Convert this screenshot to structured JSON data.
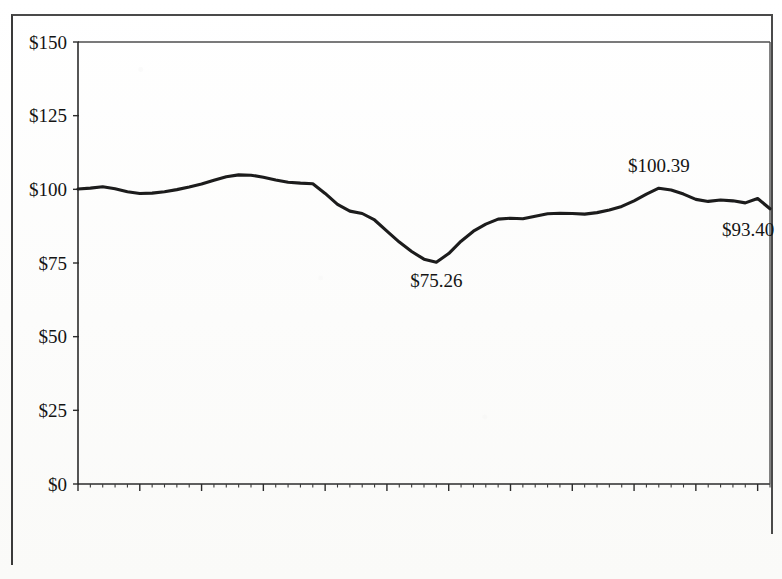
{
  "chart_data": {
    "type": "line",
    "title": "",
    "subtitle": "",
    "xlabel": "",
    "ylabel": "",
    "ylim": [
      0,
      150
    ],
    "xlim": [
      1954,
      2010
    ],
    "grid": false,
    "legend": false,
    "legend_position": "none",
    "y_ticks": [
      0,
      25,
      50,
      75,
      100,
      125,
      150
    ],
    "y_tick_labels": [
      "$0",
      "$25",
      "$50",
      "$75",
      "$100",
      "$125",
      "$150"
    ],
    "x_tick_labels": [
      "1954年",
      "1959年",
      "1964年",
      "1969年",
      "1974年",
      "1979年",
      "1984年",
      "1989年",
      "1994年",
      "1999年",
      "2004年",
      "2009年"
    ],
    "x_tick_values": [
      1954,
      1959,
      1964,
      1969,
      1974,
      1979,
      1984,
      1989,
      1994,
      1999,
      2004,
      2009
    ],
    "x_minor_step": 1,
    "line_color": "#1c1c1c",
    "series": [
      {
        "name": "value",
        "x": [
          1954,
          1955,
          1956,
          1957,
          1958,
          1959,
          1960,
          1961,
          1962,
          1963,
          1964,
          1965,
          1966,
          1967,
          1968,
          1969,
          1970,
          1971,
          1972,
          1973,
          1974,
          1975,
          1976,
          1977,
          1978,
          1979,
          1980,
          1981,
          1982,
          1983,
          1984,
          1985,
          1986,
          1987,
          1988,
          1989,
          1990,
          1991,
          1992,
          1993,
          1994,
          1995,
          1996,
          1997,
          1998,
          1999,
          2000,
          2001,
          2002,
          2003,
          2004,
          2005,
          2006,
          2007,
          2008,
          2009,
          2010
        ],
        "values": [
          100.1,
          100.4,
          100.9,
          100.2,
          99.2,
          98.6,
          98.7,
          99.2,
          99.9,
          100.8,
          101.8,
          103.1,
          104.3,
          104.9,
          104.8,
          104.1,
          103.2,
          102.4,
          102.1,
          101.9,
          98.6,
          94.9,
          92.6,
          91.8,
          89.6,
          85.8,
          82.1,
          78.9,
          76.3,
          75.26,
          78.2,
          82.4,
          85.8,
          88.2,
          89.9,
          90.2,
          90.0,
          90.9,
          91.7,
          91.9,
          91.8,
          91.6,
          92.1,
          93.0,
          94.2,
          96.1,
          98.4,
          100.39,
          99.8,
          98.4,
          96.6,
          95.9,
          96.4,
          96.1,
          95.4,
          96.9,
          93.4
        ]
      }
    ],
    "annotations": [
      {
        "label": "$75.26",
        "x": 1983,
        "y": 75.26,
        "position": "below"
      },
      {
        "label": "$100.39",
        "x": 2001,
        "y": 100.39,
        "position": "above"
      },
      {
        "label": "$93.40",
        "x": 2010,
        "y": 93.4,
        "position": "below-left"
      }
    ]
  }
}
